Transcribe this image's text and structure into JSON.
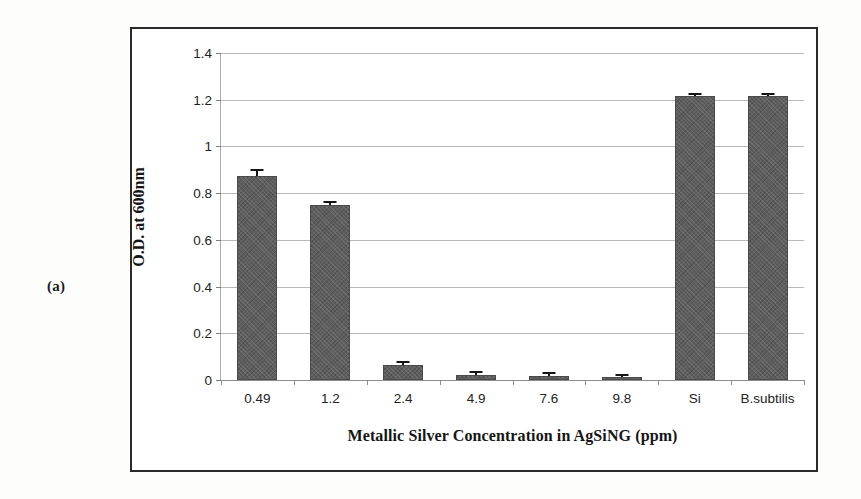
{
  "panel": {
    "label": "(a)"
  },
  "chart_data": {
    "type": "bar",
    "title": "",
    "xlabel": "Metallic Silver Concentration in AgSiNG (ppm)",
    "ylabel": "O.D. at 600nm",
    "categories": [
      "0.49",
      "1.2",
      "2.4",
      "4.9",
      "7.6",
      "9.8",
      "Si",
      "B.subtilis"
    ],
    "values": [
      0.875,
      0.75,
      0.063,
      0.022,
      0.018,
      0.012,
      1.215,
      1.215
    ],
    "errors": [
      0.022,
      0.006,
      0.008,
      0.006,
      0.006,
      0.005,
      0.006,
      0.006
    ],
    "ylim": [
      0,
      1.4
    ],
    "yticks": [
      "0",
      "0.2",
      "0.4",
      "0.6",
      "0.8",
      "1",
      "1.2",
      "1.4"
    ],
    "ytick_values": [
      0,
      0.2,
      0.4,
      0.6,
      0.8,
      1,
      1.2,
      1.4
    ],
    "grid": true,
    "legend": false,
    "bar_color": "#5e5e5e",
    "grid_color": "#b9b9b9",
    "axis_color": "#8d8d8d",
    "error_color": "#141414"
  }
}
